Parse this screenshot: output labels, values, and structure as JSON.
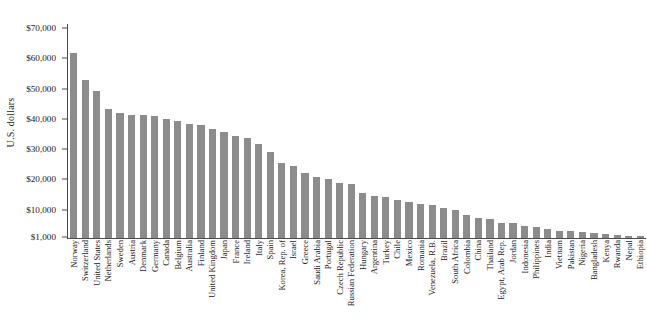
{
  "chart_data": {
    "type": "bar",
    "title": "",
    "xlabel": "",
    "ylabel": "U.S. dollars",
    "ylim": [
      1000,
      70000
    ],
    "ytick_labels": [
      "$70,000",
      "$60,000",
      "$50,000",
      "$40,000",
      "$30,000",
      "$20,000",
      "$10,000",
      "$1,000"
    ],
    "ytick_values": [
      70000,
      60000,
      50000,
      40000,
      30000,
      20000,
      10000,
      1000
    ],
    "grid": false,
    "legend": "none",
    "bar_color": "#8c8c8c",
    "axis_color": "#4a4a4a",
    "categories": [
      "Norway",
      "Switzerland",
      "United States",
      "Netherlands",
      "Sweden",
      "Austria",
      "Denmark",
      "Germany",
      "Canada",
      "Belgium",
      "Australia",
      "Finland",
      "United Kingdom",
      "Japan",
      "France",
      "Ireland",
      "Italy",
      "Spain",
      "Korea, Rep. of",
      "Israel",
      "Greece",
      "Saudi Arabia",
      "Portugal",
      "Czech Republic",
      "Russian Federation",
      "Hungary",
      "Argentina",
      "Turkey",
      "Chile",
      "Mexico",
      "Romania",
      "Venezuela, R.B.",
      "Brazil",
      "South Africa",
      "Colombia",
      "China",
      "Thailand",
      "Egypt, Arab Rep.",
      "Jordan",
      "Indonesia",
      "Philippines",
      "India",
      "Vietnam",
      "Pakistan",
      "Nigeria",
      "Bangladesh",
      "Kenya",
      "Rwanda",
      "Nepal",
      "Ethiopia"
    ],
    "values": [
      61800,
      52800,
      49200,
      43300,
      42000,
      41300,
      41200,
      41000,
      39900,
      39300,
      38300,
      38100,
      36500,
      35700,
      34500,
      33600,
      31800,
      29100,
      25300,
      24600,
      22000,
      20700,
      20200,
      18800,
      18500,
      15600,
      14700,
      14100,
      13300,
      12400,
      11900,
      11500,
      10700,
      9900,
      8400,
      7400,
      6800,
      5700,
      5500,
      4800,
      4300,
      3500,
      3100,
      2900,
      2600,
      2300,
      2000,
      1800,
      1500,
      1300
    ]
  }
}
